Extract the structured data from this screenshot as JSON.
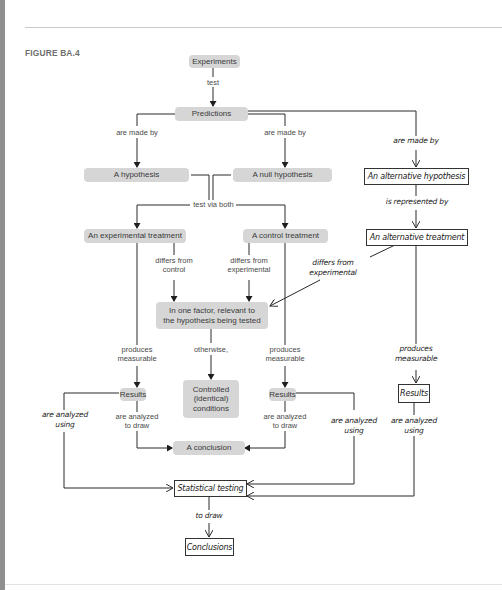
{
  "figure": {
    "label": "FIGURE BA.4"
  },
  "nodes": {
    "experiments": "Experiments",
    "predictions": "Predictions",
    "hypothesis": "A hypothesis",
    "null_hypothesis": "A null hypothesis",
    "alt_hypothesis": "An alternative hypothesis",
    "experimental_treatment": "An experimental treatment",
    "control_treatment": "A control treatment",
    "alt_treatment": "An alternative treatment",
    "one_factor_line1": "In one factor, relevant to",
    "one_factor_line2": "the hypothesis being tested",
    "results_left": "Results",
    "controlled_line1": "Controlled",
    "controlled_line2": "(identical)",
    "controlled_line3": "conditions",
    "results_mid": "Results",
    "results_right": "Results",
    "conclusion": "A conclusion",
    "statistical_testing": "Statistical testing",
    "conclusions": "Conclusions"
  },
  "labels": {
    "test": "test",
    "made_by_left": "are made by",
    "made_by_mid": "are made by",
    "made_by_right": "are made by",
    "test_via_both": "test via both",
    "is_represented_by": "is represented by",
    "differs_control_1": "differs from",
    "differs_control_2": "control",
    "differs_exp_1": "differs from",
    "differs_exp_2": "experimental",
    "differs_alt_1": "differs from",
    "differs_alt_2": "experimental",
    "produces_left_1": "produces",
    "produces_left_2": "measurable",
    "otherwise": "otherwise,",
    "produces_mid_1": "produces",
    "produces_mid_2": "measurable",
    "produces_right_1": "produces",
    "produces_right_2": "measurable",
    "analyzed_draw_left_1": "are analyzed",
    "analyzed_draw_left_2": "to draw",
    "analyzed_draw_mid_1": "are analyzed",
    "analyzed_draw_mid_2": "to draw",
    "analyzed_using_left_1": "are analyzed",
    "analyzed_using_left_2": "using",
    "analyzed_using_mid_1": "are analyzed",
    "analyzed_using_mid_2": "using",
    "analyzed_using_right_1": "are analyzed",
    "analyzed_using_right_2": "using",
    "to_draw": "to draw"
  },
  "colors": {
    "node_fill": "#d6d6d6",
    "line": "#2a2a2a",
    "left_bar": "#8f8f8f"
  }
}
